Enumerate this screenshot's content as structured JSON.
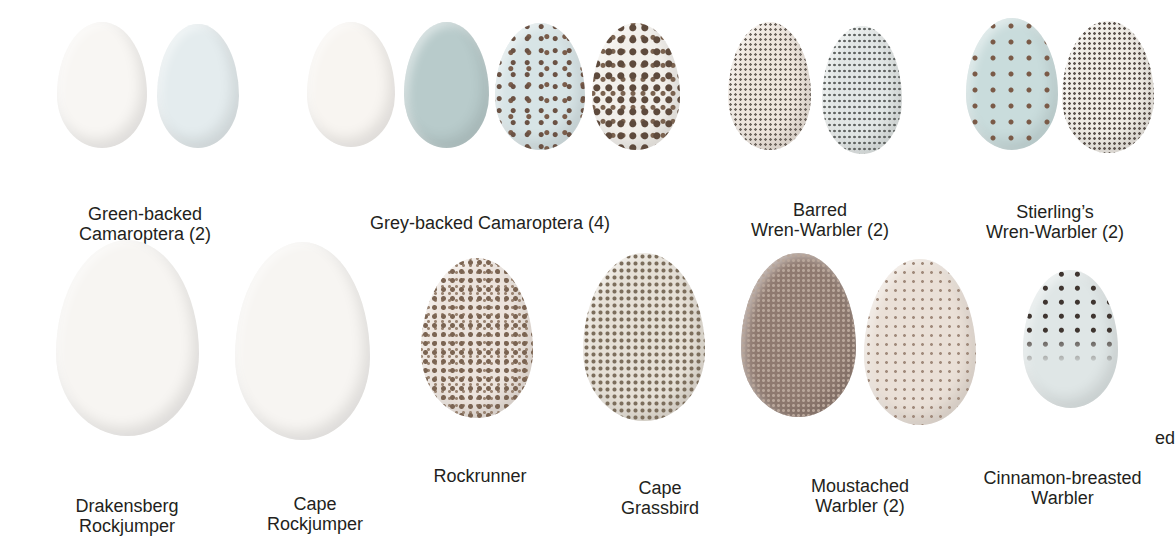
{
  "plate": {
    "groups": [
      {
        "name": "Green-backed Camaroptera",
        "count": "(2)",
        "label_line1": "Green-backed",
        "label_line2": "Camaroptera (2)"
      },
      {
        "name": "Grey-backed Camaroptera",
        "count": "(4)",
        "label_line1": "Grey-backed Camaroptera (4)"
      },
      {
        "name": "Barred Wren-Warbler",
        "count": "(2)",
        "label_line1": "Barred",
        "label_line2": "Wren-Warbler (2)"
      },
      {
        "name": "Stierling's Wren-Warbler",
        "count": "(2)",
        "label_line1": "Stierling’s",
        "label_line2": "Wren-Warbler (2)"
      },
      {
        "name": "Drakensberg Rockjumper",
        "label_line1": "Drakensberg",
        "label_line2": "Rockjumper"
      },
      {
        "name": "Cape Rockjumper",
        "label_line1": "Cape",
        "label_line2": "Rockjumper"
      },
      {
        "name": "Rockrunner",
        "label_line1": "Rockrunner"
      },
      {
        "name": "Cape Grassbird",
        "label_line1": "Cape",
        "label_line2": "Grassbird"
      },
      {
        "name": "Moustached Warbler",
        "count": "(2)",
        "label_line1": "Moustached",
        "label_line2": "Warbler (2)"
      },
      {
        "name": "Cinnamon-breasted Warbler",
        "label_line1": "Cinnamon-breasted",
        "label_line2": "Warbler"
      }
    ],
    "partial_label_right_edge": "ed"
  },
  "colors": {
    "background": "#ffffff",
    "text": "#231f20",
    "egg_white": "#f7f5f2",
    "egg_pale_blue": "#e3ecee",
    "egg_blue_grey": "#b9cccd",
    "egg_speckled_cream": "#e8dfd6",
    "egg_brown": "#8a7368",
    "speckle_dark": "#5a4a40"
  }
}
